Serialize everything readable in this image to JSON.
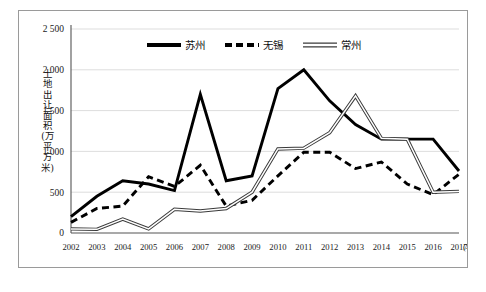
{
  "chart_data": {
    "type": "line",
    "title": "",
    "xlabel": "(年份)",
    "ylabel": "土地出让面积(万平方米)",
    "x": [
      2002,
      2003,
      2004,
      2005,
      2006,
      2007,
      2008,
      2009,
      2010,
      2011,
      2012,
      2013,
      2014,
      2015,
      2016,
      2017
    ],
    "xticklabels": [
      "2002",
      "2003",
      "2004",
      "2005",
      "2006",
      "2007",
      "2008",
      "2009",
      "2010",
      "2011",
      "2012",
      "2013",
      "2014",
      "2015",
      "2016",
      "2017"
    ],
    "yticklabels": [
      "0",
      "500",
      "1 000",
      "1 500",
      "2 000",
      "2 500"
    ],
    "yticks": [
      0,
      500,
      1000,
      1500,
      2000,
      2500
    ],
    "ylim": [
      0,
      2500
    ],
    "grid": "horizontal",
    "legend_position": "top-center",
    "series": [
      {
        "name": "苏州",
        "style": "solid-thick",
        "color": "#000000",
        "values": [
          200,
          450,
          640,
          600,
          520,
          1700,
          640,
          700,
          1770,
          2000,
          1620,
          1330,
          1150,
          1150,
          1150,
          760
        ]
      },
      {
        "name": "无锡",
        "style": "dashed-thick",
        "color": "#000000",
        "values": [
          130,
          300,
          330,
          690,
          570,
          830,
          330,
          400,
          700,
          990,
          990,
          790,
          870,
          600,
          470,
          720
        ]
      },
      {
        "name": "常州",
        "style": "double-thin",
        "color": "#666666",
        "values": [
          50,
          45,
          170,
          50,
          290,
          270,
          300,
          500,
          1030,
          1040,
          1230,
          1680,
          1160,
          1150,
          500,
          510
        ]
      }
    ]
  },
  "legend": {
    "items": [
      {
        "label": "苏州"
      },
      {
        "label": "无锡"
      },
      {
        "label": "常州"
      }
    ]
  },
  "axis": {
    "y_title": "土地出让面积(万平方米)",
    "x_unit": "(年份)"
  }
}
